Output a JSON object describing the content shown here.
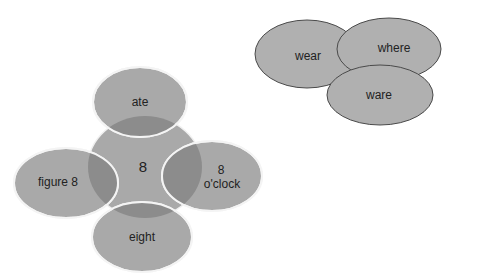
{
  "diagram": {
    "homophone_cluster": {
      "center": {
        "label": "8"
      },
      "petals": [
        {
          "position": "top",
          "label": "ate"
        },
        {
          "position": "left",
          "label": "figure 8"
        },
        {
          "position": "right",
          "line1": "8",
          "line2": "o'clock"
        },
        {
          "position": "bottom",
          "label": "eight"
        }
      ]
    },
    "overlap_cluster": {
      "ovals": [
        {
          "label": "wear"
        },
        {
          "label": "where"
        },
        {
          "label": "ware"
        }
      ]
    },
    "colors": {
      "fill": "#a8a8a8",
      "overlap": "#8e8e8e",
      "stroke_light": "#f2f2f2",
      "stroke_dark": "#555555",
      "text": "#222222"
    }
  }
}
